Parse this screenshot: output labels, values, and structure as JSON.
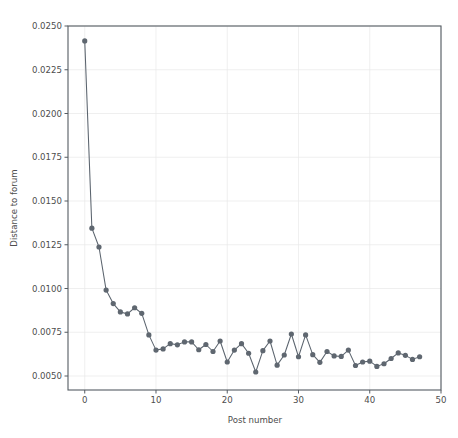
{
  "top_strip": {
    "faint_text": ""
  },
  "chart_data": {
    "type": "line",
    "title": "",
    "xlabel": "Post number",
    "ylabel": "Distance to forum",
    "xlim": [
      -2.35,
      50
    ],
    "ylim": [
      0.005,
      0.025
    ],
    "grid": true,
    "legend": "none",
    "marker": "circle",
    "line_color": "#5b646e",
    "marker_color": "#5f6770",
    "grid_color": "#e8e8e8",
    "xticks": [
      0,
      10,
      20,
      30,
      40,
      50
    ],
    "xtick_labels": [
      "0",
      "10",
      "20",
      "30",
      "40",
      "50"
    ],
    "yticks": [
      0.005,
      0.0075,
      0.01,
      0.0125,
      0.015,
      0.0175,
      0.02,
      0.0225,
      0.025
    ],
    "ytick_labels": [
      "0.0050",
      "0.0075",
      "0.0100",
      "0.0125",
      "0.0150",
      "0.0175",
      "0.0200",
      "0.0225",
      "0.0250"
    ],
    "x": [
      0,
      1,
      2,
      3,
      4,
      5,
      6,
      7,
      8,
      9,
      10,
      11,
      12,
      13,
      14,
      15,
      16,
      17,
      18,
      19,
      20,
      21,
      22,
      23,
      24,
      25,
      26,
      27,
      28,
      29,
      30,
      31,
      32,
      33,
      34,
      35,
      36,
      37,
      38,
      39,
      40,
      41,
      42,
      43,
      44,
      45,
      46,
      47
    ],
    "values": [
      0.02415,
      0.01345,
      0.01237,
      0.00991,
      0.00914,
      0.00866,
      0.00855,
      0.0089,
      0.00858,
      0.00735,
      0.00648,
      0.00655,
      0.00685,
      0.00678,
      0.00695,
      0.00695,
      0.0065,
      0.0068,
      0.0064,
      0.007,
      0.0058,
      0.00648,
      0.00685,
      0.0063,
      0.00523,
      0.00645,
      0.007,
      0.00562,
      0.0062,
      0.0074,
      0.0061,
      0.00735,
      0.00622,
      0.00578,
      0.0064,
      0.00615,
      0.00612,
      0.00648,
      0.0056,
      0.0058,
      0.00585,
      0.00555,
      0.0057,
      0.006,
      0.00632,
      0.00618,
      0.00595,
      0.0061
    ]
  }
}
